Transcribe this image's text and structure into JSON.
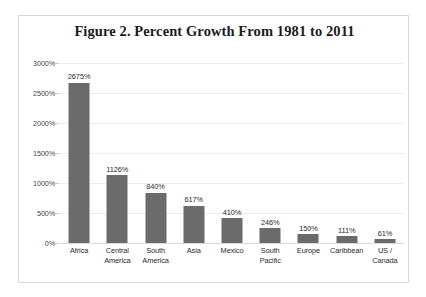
{
  "chart_data": {
    "type": "bar",
    "title": "Figure 2. Percent Growth From 1981 to 2011",
    "xlabel": "",
    "ylabel": "",
    "ylim": [
      0,
      3000
    ],
    "yticks": [
      "0%",
      "500%",
      "1000%",
      "1500%",
      "2000%",
      "2500%",
      "3000%"
    ],
    "ytick_values": [
      0,
      500,
      1000,
      1500,
      2000,
      2500,
      3000
    ],
    "grid": true,
    "legend": false,
    "categories": [
      "Africa",
      "Central America",
      "South America",
      "Asia",
      "Mexico",
      "South Pacific",
      "Europe",
      "Caribbean",
      "US / Canada"
    ],
    "category_lines": [
      [
        "Africa",
        ""
      ],
      [
        "Central",
        "America"
      ],
      [
        "South",
        "America"
      ],
      [
        "Asia",
        ""
      ],
      [
        "Mexico",
        ""
      ],
      [
        "South",
        "Pacific"
      ],
      [
        "Europe",
        ""
      ],
      [
        "Caribbean",
        ""
      ],
      [
        "US /",
        "Canada"
      ]
    ],
    "values": [
      2675,
      1126,
      840,
      617,
      410,
      246,
      150,
      111,
      61
    ],
    "value_labels": [
      "2675%",
      "1126%",
      "840%",
      "617%",
      "410%",
      "246%",
      "150%",
      "111%",
      "61%"
    ],
    "bar_color": "#6b6b6b",
    "grid_color": "#ededed",
    "border_color": "#d8d8d8",
    "background": "#ffffff",
    "text_color": "#2b2b2b"
  }
}
